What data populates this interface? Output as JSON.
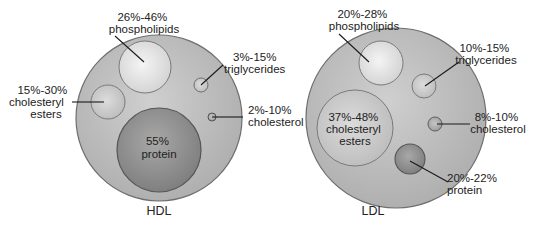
{
  "diagram": {
    "hdl": {
      "title": "HDL",
      "components": {
        "phospholipids": {
          "line1": "26%-46%",
          "line2": "phospholipids"
        },
        "triglycerides": {
          "line1": "3%-15%",
          "line2": "triglycerides"
        },
        "cholesteryl_esters": {
          "line1": "15%-30%",
          "line2": "cholesteryl",
          "line3": "esters"
        },
        "cholesterol": {
          "line1": "2%-10%",
          "line2": "cholesterol"
        },
        "protein": {
          "line1": "55%",
          "line2": "protein"
        }
      }
    },
    "ldl": {
      "title": "LDL",
      "components": {
        "phospholipids": {
          "line1": "20%-28%",
          "line2": "phospholipids"
        },
        "triglycerides": {
          "line1": "10%-15%",
          "line2": "triglycerides"
        },
        "cholesteryl_esters": {
          "line1": "37%-48%",
          "line2": "cholesteryl",
          "line3": "esters"
        },
        "cholesterol": {
          "line1": "8%-10%",
          "line2": "cholesterol"
        },
        "protein": {
          "line1": "20%-22%",
          "line2": "protein"
        }
      }
    },
    "colors": {
      "outer_fill": "#bdbdbd",
      "outer_stroke": "#6e6e6e",
      "light_sphere": "#e6e6e6",
      "protein_dark": "#8f8f8f",
      "text": "#222222"
    }
  }
}
